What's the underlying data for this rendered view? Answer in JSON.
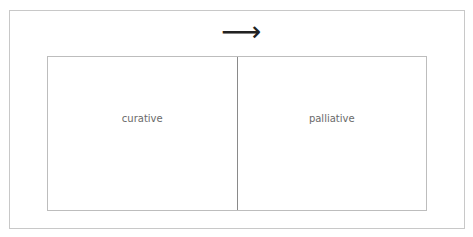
{
  "diagram": {
    "arrow": {
      "icon": "arrow-right-icon",
      "glyph": "⟶"
    },
    "cells": [
      {
        "label": "curative"
      },
      {
        "label": "palliative"
      }
    ]
  }
}
